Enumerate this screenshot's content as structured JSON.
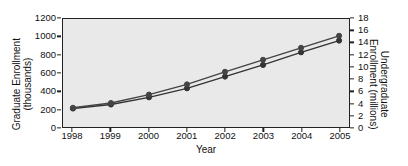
{
  "chart_data": {
    "type": "line",
    "title": "",
    "xlabel": "Year",
    "ylabel": "Graduate Enrollment\n(thousands)",
    "y2label": "Undergraduate\nEnrollment (millions)",
    "categories": [
      "1998",
      "1999",
      "2000",
      "2001",
      "2002",
      "2003",
      "2004",
      "2005"
    ],
    "x": [
      1998,
      1999,
      2000,
      2001,
      2002,
      2003,
      2004,
      2005
    ],
    "ylim": [
      0,
      1200
    ],
    "yticks": [
      0,
      200,
      400,
      600,
      800,
      1000,
      1200
    ],
    "y2lim": [
      0,
      18
    ],
    "y2ticks": [
      0,
      2,
      4,
      6,
      8,
      10,
      12,
      14,
      16,
      18
    ],
    "grid": false,
    "legend": "none",
    "series": [
      {
        "name": "Graduate Enrollment",
        "axis": "left",
        "units": "thousands",
        "marker": "circle",
        "color": "#333333",
        "values": [
          205,
          250,
          330,
          430,
          560,
          690,
          830,
          960
        ]
      },
      {
        "name": "Undergraduate Enrollment",
        "axis": "right",
        "units": "millions",
        "marker": "circle",
        "color": "#444444",
        "values": [
          3.2,
          4.0,
          5.4,
          7.1,
          9.2,
          11.2,
          13.2,
          15.2
        ]
      }
    ]
  },
  "style": {
    "plot_background": "#e9e9e9",
    "frame_color": "#222222",
    "text_color": "#111111",
    "page_background": "#ffffff"
  }
}
